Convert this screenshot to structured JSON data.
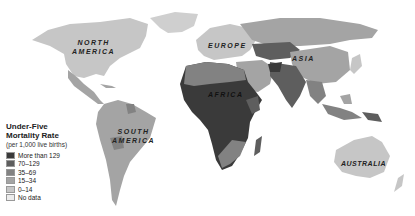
{
  "map": {
    "title": "Under-Five Mortality Rate",
    "regions": [
      {
        "id": "north-america",
        "label_lines": [
          "NORTH",
          "AMERICA"
        ]
      },
      {
        "id": "south-america",
        "label_lines": [
          "SOUTH",
          "AMERICA"
        ]
      },
      {
        "id": "europe",
        "label_lines": [
          "EUROPE"
        ]
      },
      {
        "id": "asia",
        "label_lines": [
          "ASIA"
        ]
      },
      {
        "id": "africa",
        "label_lines": [
          "AFRICA"
        ]
      },
      {
        "id": "australia",
        "label_lines": [
          "AUSTRALIA"
        ]
      }
    ]
  },
  "legend": {
    "title_line1": "Under-Five",
    "title_line2": "Mortality Rate",
    "subtitle": "(per 1,000 live births)",
    "items": [
      {
        "label": "More than 129",
        "color": "#3a3a3a"
      },
      {
        "label": "70–129",
        "color": "#5e5e5e"
      },
      {
        "label": "35–69",
        "color": "#828282"
      },
      {
        "label": "15–34",
        "color": "#a4a4a4"
      },
      {
        "label": "0–14",
        "color": "#c6c6c6"
      },
      {
        "label": "No data",
        "color": "#ececec"
      }
    ]
  }
}
